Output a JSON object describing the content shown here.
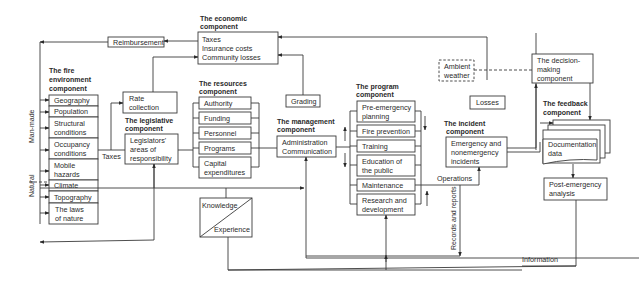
{
  "diagram": {
    "economic": {
      "title_line1": "The economic",
      "title_line2": "component",
      "items": [
        "Taxes",
        "Insurance costs",
        "Community losses"
      ]
    },
    "reimbursement": "Reimbursement",
    "fire_environment": {
      "title_line1": "The fire",
      "title_line2": "environment",
      "title_line3": "component",
      "items": [
        {
          "l1": "Geography",
          "l2": ""
        },
        {
          "l1": "Population",
          "l2": ""
        },
        {
          "l1": "Structural",
          "l2": "conditions"
        },
        {
          "l1": "Occupancy",
          "l2": "conditions"
        },
        {
          "l1": "Mobile",
          "l2": "hazards"
        },
        {
          "l1": "Climate",
          "l2": ""
        },
        {
          "l1": "Topography",
          "l2": ""
        },
        {
          "l1": "The laws",
          "l2": "of nature"
        }
      ],
      "side_label_man_made": "Man-made",
      "side_label_natural": "Natural"
    },
    "rate_collection": {
      "l1": "Rate",
      "l2": "collection"
    },
    "legislative": {
      "title_line1": "The legislative",
      "title_line2": "component",
      "box_l1": "Legislators'",
      "box_l2": "areas of",
      "box_l3": "responsibility"
    },
    "taxes_label": "Taxes",
    "resources": {
      "title_line1": "The resources",
      "title_line2": "component",
      "items": [
        {
          "l1": "Authority",
          "l2": ""
        },
        {
          "l1": "Funding",
          "l2": ""
        },
        {
          "l1": "Personnel",
          "l2": ""
        },
        {
          "l1": "Programs",
          "l2": ""
        },
        {
          "l1": "Capital",
          "l2": "expenditures"
        }
      ]
    },
    "grading": "Grading",
    "management": {
      "title_line1": "The management",
      "title_line2": "component",
      "box_l1": "Administration",
      "box_l2": "Communication"
    },
    "knowledge": "Knowledge",
    "experience": "Experience",
    "program": {
      "title_line1": "The program",
      "title_line2": "component",
      "items": [
        {
          "l1": "Pre-emergency",
          "l2": "planning"
        },
        {
          "l1": "Fire prevention",
          "l2": ""
        },
        {
          "l1": "Training",
          "l2": ""
        },
        {
          "l1": "Education of",
          "l2": "the public"
        },
        {
          "l1": "Maintenance",
          "l2": ""
        },
        {
          "l1": "Research and",
          "l2": "development"
        }
      ]
    },
    "ambient_weather": {
      "l1": "Ambient",
      "l2": "weather"
    },
    "losses": "Losses",
    "incident": {
      "title_line1": "The incident",
      "title_line2": "component",
      "box_l1": "Emergency and",
      "box_l2": "nonemergency",
      "box_l3": "incidents"
    },
    "operations": "Operations",
    "records_and_reports": "Records and reports",
    "decision_making": {
      "l1": "The decision-",
      "l2": "making",
      "l3": "component"
    },
    "feedback": {
      "title_line1": "The feedback",
      "title_line2": "component",
      "doc_l1": "Documentation",
      "doc_l2": "data"
    },
    "post_emergency": {
      "l1": "Post-emergency",
      "l2": "analysis"
    },
    "information": "Information"
  }
}
